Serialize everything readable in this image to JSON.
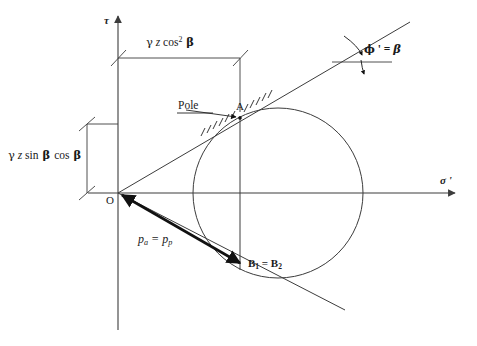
{
  "figure": {
    "background_color": "#ffffff",
    "line_color": "#3c3c3c",
    "text_color": "#1a1a1a",
    "width": 477,
    "height": 346
  },
  "axes": {
    "vertical": {
      "label": "τ",
      "name": "shear-stress-axis",
      "x": 118,
      "tip_y": 13,
      "base_y": 330
    },
    "horizontal": {
      "label": "σ '",
      "name": "effective-normal-stress-axis",
      "y": 193,
      "tip_x": 458,
      "base_x": 88
    }
  },
  "origin": {
    "label": "O",
    "x": 118,
    "y": 193
  },
  "circle": {
    "center_x": 278,
    "center_y": 193,
    "radius": 85
  },
  "points": {
    "pole": {
      "label": "A",
      "x": 240,
      "y": 118
    },
    "bottom": {
      "label_main": "B",
      "sub1": "1",
      "equals": " = ",
      "label_main2": "B",
      "sub2": "2",
      "full": "B1 = B2",
      "x": 242,
      "y": 265
    }
  },
  "annotations": {
    "pole_callout": {
      "label": "Pole",
      "x": 181,
      "y": 100
    },
    "angle": {
      "phi": "ϕ",
      "prime": " '",
      "equals": " = ",
      "beta": "β",
      "full": "ϕ ' = β",
      "x": 364,
      "y": 44
    },
    "pressure": {
      "p": "p",
      "sub_a": "a",
      "equals": " = ",
      "p2": "p",
      "sub_p": "p",
      "full": "pa = pp",
      "x": 138,
      "y": 234
    }
  },
  "dimensions": {
    "horizontal_dim": {
      "label_gamma": "γ",
      "label_z": " z ",
      "label_cos": "cos",
      "label_exp": "2",
      "label_beta": " β",
      "full": "γ z cos² β",
      "line_y": 58,
      "x_start": 118,
      "x_end": 240,
      "text_x": 146,
      "text_y": 38
    },
    "vertical_dim": {
      "label_gamma": "γ",
      "label_z": " z ",
      "label_sin": "sin",
      "label_beta1": " β ",
      "label_cos": "cos",
      "label_beta2": " β",
      "full": "γ z sin β cos β",
      "line_x": 87,
      "y_start": 124,
      "y_end": 193,
      "text_x": 8,
      "text_y": 152
    }
  },
  "failure_lines": {
    "upper": {
      "x1": 118,
      "y1": 193,
      "x2": 410,
      "y2": 22
    },
    "lower": {
      "x1": 118,
      "y1": 193,
      "x2": 345,
      "y2": 310
    },
    "vertical_through_pole": {
      "x": 240,
      "y1": 116,
      "y2": 270
    }
  }
}
